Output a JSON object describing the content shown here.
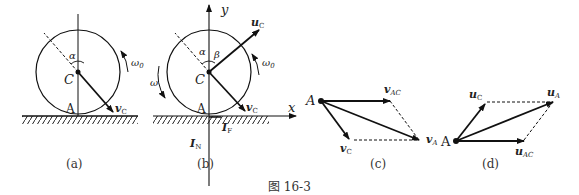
{
  "figure_caption": "图 16-3",
  "panels": {
    "a": {
      "caption": "(a)",
      "labels": {
        "center": "C",
        "contact": "A",
        "angle": "α",
        "omega": "ω",
        "omega_sub": "0",
        "vel": "v",
        "vel_sub": "C"
      }
    },
    "b": {
      "caption": "(b)",
      "labels": {
        "center": "C",
        "contact": "A",
        "alpha": "α",
        "beta": "β",
        "omega": "ω",
        "omega0": "ω",
        "omega0_sub": "0",
        "u": "u",
        "u_sub": "C",
        "v": "v",
        "v_sub": "C",
        "x_axis": "x",
        "y_axis": "y",
        "IN": "I",
        "IN_sub": "N",
        "IF": "I",
        "IF_sub": "F"
      }
    },
    "c": {
      "caption": "(c)",
      "labels": {
        "origin": "A",
        "vAC": "v",
        "vAC_sub": "AC",
        "vC": "v",
        "vC_sub": "C",
        "vA": "v",
        "vA_sub": "A"
      }
    },
    "d": {
      "caption": "(d)",
      "labels": {
        "origin": "A",
        "uC": "u",
        "uC_sub": "C",
        "uA": "u",
        "uA_sub": "A",
        "uAC": "u",
        "uAC_sub": "AC"
      }
    }
  }
}
